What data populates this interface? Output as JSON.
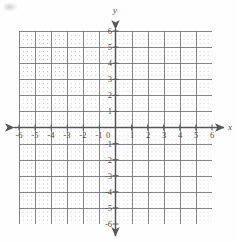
{
  "figure": {
    "kind": "cartesian-coordinate-plane",
    "origin_label": "0",
    "x_axis": {
      "name": "x",
      "min": -6,
      "max": 6,
      "tick_step": 1,
      "ticks": [
        "-6",
        "-5",
        "-4",
        "-3",
        "-2",
        "-1",
        "1",
        "2",
        "3",
        "4",
        "5",
        "6"
      ],
      "arrows": "both"
    },
    "y_axis": {
      "name": "y",
      "min": -6,
      "max": 6,
      "tick_step": 1,
      "ticks": [
        "6",
        "5",
        "4",
        "3",
        "2",
        "1",
        "-1",
        "-2",
        "-3",
        "-4",
        "-5",
        "-6"
      ],
      "arrows": "both"
    },
    "grid": {
      "visible": true,
      "style": "dotted",
      "unit_spacing_px": 16.08,
      "subdivisions_per_unit": 4
    },
    "colors": {
      "axis": "#55555c",
      "grid_unit": "#696970",
      "grid_fine": "#82828a",
      "label": "#4a4a50",
      "background": "#fefefe"
    },
    "plotted_data": {
      "series": [],
      "points": [],
      "note": "empty grid - no curves or points plotted"
    }
  }
}
